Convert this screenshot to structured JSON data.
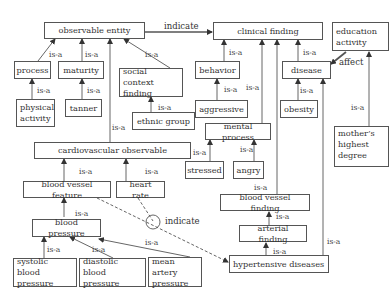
{
  "nodes": {
    "observable_entity": "observable entity",
    "clinical_finding": "clinical finding",
    "education_activity": "education activity",
    "process": "process",
    "maturity": "maturity",
    "social_context_finding": "social context finding",
    "behavior": "behavior",
    "disease": "disease",
    "physical_activity": "physical activity",
    "tanner": "tanner",
    "ethnic_group": "ethnic group",
    "aggressive": "aggressive",
    "obesity": "obesity",
    "mental_process": "mental process",
    "mothers_highest_degree": "mother’s highest degree",
    "cardiovascular_observable": "cardiovascular observable",
    "stressed": "stressed",
    "angry": "angry",
    "blood_vessel_feature": "blood vessel feature",
    "heart_rate": "heart rate",
    "blood_vessel_finding": "blood vessel finding",
    "blood_pressure": "blood pressure",
    "arterial_finding": "arterial finding",
    "systolic_blood_pressure": "systolic blood pressure",
    "diastolic_blood_pressure": "diastolic blood pressure",
    "mean_artery_pressure": "mean artery pressure",
    "hypertensive_diseases": "hypertensive diseases"
  },
  "labels": {
    "is_a": "is-a",
    "indicate": "indicate",
    "affect": "affect"
  },
  "edges": [
    {
      "from": "process",
      "to": "observable entity",
      "label": "is-a"
    },
    {
      "from": "maturity",
      "to": "observable entity",
      "label": "is-a"
    },
    {
      "from": "social context finding",
      "to": "observable entity",
      "label": "is-a"
    },
    {
      "from": "cardiovascular observable",
      "to": "observable entity",
      "label": "is-a"
    },
    {
      "from": "physical activity",
      "to": "process",
      "label": "is-a"
    },
    {
      "from": "tanner",
      "to": "maturity",
      "label": "is-a"
    },
    {
      "from": "ethnic group",
      "to": "social context finding",
      "label": "is-a"
    },
    {
      "from": "observable entity",
      "to": "clinical finding",
      "label": "indicate"
    },
    {
      "from": "behavior",
      "to": "clinical finding",
      "label": "is-a"
    },
    {
      "from": "mental process",
      "to": "clinical finding",
      "label": "is-a"
    },
    {
      "from": "blood vessel finding",
      "to": "clinical finding",
      "label": "is-a"
    },
    {
      "from": "disease",
      "to": "clinical finding",
      "label": "is-a"
    },
    {
      "from": "aggressive",
      "to": "behavior",
      "label": "is-a"
    },
    {
      "from": "stressed",
      "to": "mental process",
      "label": "is-a"
    },
    {
      "from": "angry",
      "to": "mental process",
      "label": "is-a"
    },
    {
      "from": "obesity",
      "to": "disease",
      "label": "is-a"
    },
    {
      "from": "hypertensive diseases",
      "to": "disease",
      "label": "is-a"
    },
    {
      "from": "education activity",
      "to": "disease",
      "label": "affect"
    },
    {
      "from": "mother’s highest degree",
      "to": "education activity",
      "label": "is-a"
    },
    {
      "from": "blood vessel feature",
      "to": "cardiovascular observable",
      "label": "is-a"
    },
    {
      "from": "heart rate",
      "to": "cardiovascular observable",
      "label": "is-a"
    },
    {
      "from": "blood pressure",
      "to": "blood vessel feature",
      "label": "is-a"
    },
    {
      "from": "systolic blood pressure",
      "to": "blood pressure",
      "label": "is-a"
    },
    {
      "from": "diastolic blood pressure",
      "to": "blood pressure",
      "label": "is-a"
    },
    {
      "from": "mean artery pressure",
      "to": "blood pressure",
      "label": "is-a"
    },
    {
      "from": "arterial finding",
      "to": "blood vessel finding",
      "label": "is-a"
    },
    {
      "from": "hypertensive diseases",
      "to": "arterial finding",
      "label": "is-a"
    },
    {
      "from": "blood vessel feature + heart rate",
      "to": "hypertensive diseases",
      "label": "indicate"
    }
  ]
}
